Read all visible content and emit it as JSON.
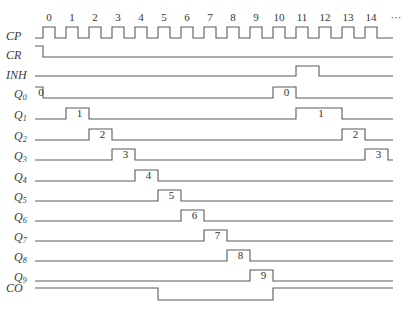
{
  "diagram": {
    "type": "timing-diagram",
    "clock": {
      "label": "CP",
      "pulse_numbers": [
        "0",
        "1",
        "2",
        "3",
        "4",
        "5",
        "6",
        "7",
        "8",
        "9",
        "10",
        "11",
        "12",
        "13",
        "14"
      ],
      "ellipsis": "···",
      "first_rise_x": 43,
      "period": 23,
      "pulse_width": 12
    },
    "signals": [
      {
        "id": "CR",
        "label": "CR",
        "sub": ""
      },
      {
        "id": "INH",
        "label": "INH",
        "sub": ""
      },
      {
        "id": "Q0",
        "label": "Q",
        "sub": "0",
        "pulses": [
          {
            "from": -1,
            "to": 0,
            "text": "0"
          },
          {
            "from": 10,
            "to": 11,
            "text": "0"
          }
        ]
      },
      {
        "id": "Q1",
        "label": "Q",
        "sub": "1",
        "pulses": [
          {
            "from": 1,
            "to": 2,
            "text": "1"
          },
          {
            "from": 11,
            "to": 13,
            "text": "1"
          }
        ]
      },
      {
        "id": "Q2",
        "label": "Q",
        "sub": "2",
        "pulses": [
          {
            "from": 2,
            "to": 3,
            "text": "2"
          },
          {
            "from": 13,
            "to": 14,
            "text": "2"
          }
        ]
      },
      {
        "id": "Q3",
        "label": "Q",
        "sub": "3",
        "pulses": [
          {
            "from": 3,
            "to": 4,
            "text": "3"
          },
          {
            "from": 14,
            "to": 15,
            "text": "3"
          }
        ]
      },
      {
        "id": "Q4",
        "label": "Q",
        "sub": "4",
        "pulses": [
          {
            "from": 4,
            "to": 5,
            "text": "4"
          }
        ]
      },
      {
        "id": "Q5",
        "label": "Q",
        "sub": "5",
        "pulses": [
          {
            "from": 5,
            "to": 6,
            "text": "5"
          }
        ]
      },
      {
        "id": "Q6",
        "label": "Q",
        "sub": "6",
        "pulses": [
          {
            "from": 6,
            "to": 7,
            "text": "6"
          }
        ]
      },
      {
        "id": "Q7",
        "label": "Q",
        "sub": "7",
        "pulses": [
          {
            "from": 7,
            "to": 8,
            "text": "7"
          }
        ]
      },
      {
        "id": "Q8",
        "label": "Q",
        "sub": "8",
        "pulses": [
          {
            "from": 8,
            "to": 9,
            "text": "8"
          }
        ]
      },
      {
        "id": "Q9",
        "label": "Q",
        "sub": "9",
        "pulses": [
          {
            "from": 9,
            "to": 10,
            "text": "9"
          }
        ]
      },
      {
        "id": "CO",
        "label": "CO",
        "sub": ""
      }
    ],
    "labels": {
      "cp": "CP",
      "cr": "CR",
      "inh": "INH",
      "co": "CO",
      "q": "Q",
      "q0_sub": "0",
      "q1_sub": "1",
      "q2_sub": "2",
      "q3_sub": "3",
      "q4_sub": "4",
      "q5_sub": "5",
      "q6_sub": "6",
      "q7_sub": "7",
      "q8_sub": "8",
      "q9_sub": "9"
    },
    "colors": {
      "line": "#5a5a5a",
      "text": "#3a3a3a",
      "background": "#ffffff"
    }
  }
}
